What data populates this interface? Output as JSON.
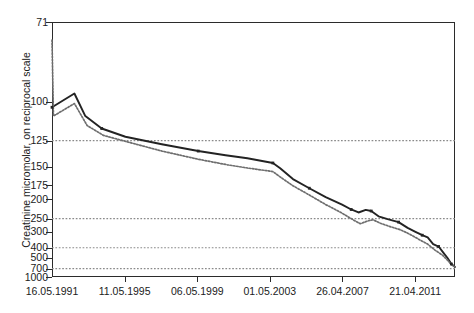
{
  "top_partial_text": "",
  "chart_data": {
    "type": "line",
    "title": "",
    "xlabel": "",
    "ylabel": "Creatinine micromolar, on reciprocal scale",
    "y_axis": {
      "scale": "reciprocal",
      "tick_labels": [
        "71",
        "100",
        "125",
        "150",
        "175",
        "200",
        "250",
        "300",
        "400",
        "500",
        "700",
        "1000"
      ],
      "tick_values": [
        71,
        100,
        125,
        150,
        175,
        200,
        250,
        300,
        400,
        500,
        700,
        1000
      ],
      "ylim": [
        71,
        1000
      ],
      "gridlines_at": [
        125,
        250,
        400,
        700
      ],
      "grid": true
    },
    "x_axis": {
      "tick_labels": [
        "16.05.1991",
        "11.05.1995",
        "06.05.1999",
        "01.05.2003",
        "26.04.2007",
        "21.04.2011"
      ],
      "tick_positions_years": [
        1991.37,
        1995.36,
        1999.35,
        2003.33,
        2007.32,
        2011.31
      ],
      "xlim_years": [
        1991.37,
        2013.5
      ],
      "grid": false
    },
    "legend": {
      "visible": false,
      "position": "none"
    },
    "series": [
      {
        "name": "solid-series",
        "style": "solid",
        "color": "#232323",
        "markers": true,
        "points": [
          {
            "x": 1991.37,
            "y": 103
          },
          {
            "x": 1992.6,
            "y": 96
          },
          {
            "x": 1993.2,
            "y": 108
          },
          {
            "x": 1994.1,
            "y": 116
          },
          {
            "x": 1995.4,
            "y": 122
          },
          {
            "x": 1997.4,
            "y": 128
          },
          {
            "x": 1999.4,
            "y": 134
          },
          {
            "x": 2000.9,
            "y": 138
          },
          {
            "x": 2002.1,
            "y": 141
          },
          {
            "x": 2003.5,
            "y": 146
          },
          {
            "x": 2003.9,
            "y": 152
          },
          {
            "x": 2004.6,
            "y": 166
          },
          {
            "x": 2005.5,
            "y": 180
          },
          {
            "x": 2006.4,
            "y": 196
          },
          {
            "x": 2007.3,
            "y": 212
          },
          {
            "x": 2007.8,
            "y": 224
          },
          {
            "x": 2008.2,
            "y": 232
          },
          {
            "x": 2008.6,
            "y": 225
          },
          {
            "x": 2008.9,
            "y": 228
          },
          {
            "x": 2009.3,
            "y": 243
          },
          {
            "x": 2009.8,
            "y": 252
          },
          {
            "x": 2010.4,
            "y": 262
          },
          {
            "x": 2010.9,
            "y": 284
          },
          {
            "x": 2011.3,
            "y": 300
          },
          {
            "x": 2011.7,
            "y": 318
          },
          {
            "x": 2012.0,
            "y": 330
          },
          {
            "x": 2012.3,
            "y": 372
          },
          {
            "x": 2012.6,
            "y": 390
          },
          {
            "x": 2012.9,
            "y": 455
          },
          {
            "x": 2013.1,
            "y": 510
          },
          {
            "x": 2013.3,
            "y": 600
          },
          {
            "x": 2013.5,
            "y": 660
          }
        ]
      },
      {
        "name": "dotted-series",
        "style": "dotted",
        "color": "#6e6e6e",
        "markers": false,
        "points": [
          {
            "x": 1991.37,
            "y": 76
          },
          {
            "x": 1991.45,
            "y": 108
          },
          {
            "x": 1992.6,
            "y": 101
          },
          {
            "x": 1993.3,
            "y": 114
          },
          {
            "x": 1994.2,
            "y": 121
          },
          {
            "x": 1995.5,
            "y": 126
          },
          {
            "x": 1997.4,
            "y": 134
          },
          {
            "x": 1999.4,
            "y": 142
          },
          {
            "x": 2001.0,
            "y": 148
          },
          {
            "x": 2002.2,
            "y": 152
          },
          {
            "x": 2003.5,
            "y": 156
          },
          {
            "x": 2003.9,
            "y": 163
          },
          {
            "x": 2004.6,
            "y": 176
          },
          {
            "x": 2005.5,
            "y": 192
          },
          {
            "x": 2006.4,
            "y": 212
          },
          {
            "x": 2007.3,
            "y": 234
          },
          {
            "x": 2007.9,
            "y": 254
          },
          {
            "x": 2008.3,
            "y": 268
          },
          {
            "x": 2008.7,
            "y": 258
          },
          {
            "x": 2009.0,
            "y": 254
          },
          {
            "x": 2009.4,
            "y": 266
          },
          {
            "x": 2009.9,
            "y": 278
          },
          {
            "x": 2010.5,
            "y": 292
          },
          {
            "x": 2011.0,
            "y": 312
          },
          {
            "x": 2011.5,
            "y": 340
          },
          {
            "x": 2012.0,
            "y": 372
          },
          {
            "x": 2012.4,
            "y": 420
          },
          {
            "x": 2012.8,
            "y": 470
          },
          {
            "x": 2013.1,
            "y": 540
          },
          {
            "x": 2013.3,
            "y": 610
          },
          {
            "x": 2013.5,
            "y": 660
          }
        ]
      }
    ]
  }
}
